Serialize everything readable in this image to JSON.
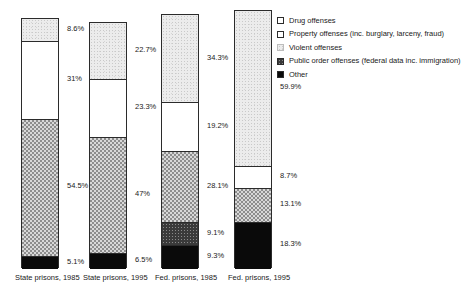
{
  "chart_data": {
    "type": "bar",
    "title": "",
    "subtitle": "",
    "xlabel": "",
    "ylabel": "",
    "stacked": true,
    "stack_mode": "percent",
    "grid": false,
    "legend_position": "top-right",
    "ylim": [
      0,
      100
    ],
    "categories": [
      "State prisons, 1985",
      "State prisons, 1995",
      "Fed. prisons, 1985",
      "Fed. prisons, 1995"
    ],
    "series": [
      {
        "name": "Violent offenses",
        "values": [
          8.6,
          22.7,
          34.3,
          59.9
        ]
      },
      {
        "name": "Drug offenses",
        "values": [
          31.0,
          23.3,
          19.2,
          8.7
        ]
      },
      {
        "name": "Property offenses",
        "values": [
          54.5,
          47.0,
          28.1,
          13.1
        ]
      },
      {
        "name": "Public order offenses",
        "values": [
          null,
          null,
          9.1,
          null
        ]
      },
      {
        "name": "Other",
        "values": [
          5.1,
          6.5,
          9.3,
          18.3
        ]
      }
    ]
  },
  "legend": {
    "items": [
      {
        "label": "Drug offenses",
        "swatch": "drug-swatch"
      },
      {
        "label": "Property offenses (inc. burglary, larceny, fraud)",
        "swatch": "property-swatch"
      },
      {
        "label": "Violent offenses",
        "swatch": "violent-swatch"
      },
      {
        "label": "Public order offenses (federal data inc. immigration)",
        "swatch": "public-order-swatch"
      },
      {
        "label": "Other",
        "swatch": "other-swatch"
      }
    ]
  },
  "bars": [
    {
      "category": "State prisons, 1985",
      "segments": [
        {
          "series": "Violent offenses",
          "label": "8.6%"
        },
        {
          "series": "Drug offenses",
          "label": "31%"
        },
        {
          "series": "Property offenses",
          "label": "54.5%"
        },
        {
          "series": "Other",
          "label": "5.1%"
        }
      ]
    },
    {
      "category": "State prisons, 1995",
      "segments": [
        {
          "series": "Violent offenses",
          "label": "22.7%"
        },
        {
          "series": "Drug offenses",
          "label": "23.3%"
        },
        {
          "series": "Property offenses",
          "label": "47%"
        },
        {
          "series": "Other",
          "label": "6.5%"
        }
      ]
    },
    {
      "category": "Fed. prisons, 1985",
      "segments": [
        {
          "series": "Violent offenses",
          "label": "34.3%"
        },
        {
          "series": "Drug offenses",
          "label": "19.2%"
        },
        {
          "series": "Property offenses",
          "label": "28.1%"
        },
        {
          "series": "Public order offenses",
          "label": "9.1%"
        },
        {
          "series": "Other",
          "label": "9.3%"
        }
      ]
    },
    {
      "category": "Fed. prisons, 1995",
      "segments": [
        {
          "series": "Violent offenses",
          "label": "59.9%"
        },
        {
          "series": "Drug offenses",
          "label": "8.7%"
        },
        {
          "series": "Property offenses",
          "label": "13.1%"
        },
        {
          "series": "Other",
          "label": "18.3%"
        }
      ]
    }
  ],
  "colors": {
    "outline": "#2b2b2b",
    "text": "#1a1a1a",
    "background": "#ffffff",
    "violent_fill": "#ececec",
    "drug_fill": "#ffffff",
    "property_fill": "#d8d8d8",
    "public_order_fill": "#3a3a3a",
    "other_fill": "#0a0a0a"
  },
  "layout": {
    "bar_left": [
      21,
      89,
      161,
      234
    ],
    "bar_top": [
      18,
      22,
      14,
      10
    ],
    "bar_bottom": 268,
    "bar_width": 38
  }
}
